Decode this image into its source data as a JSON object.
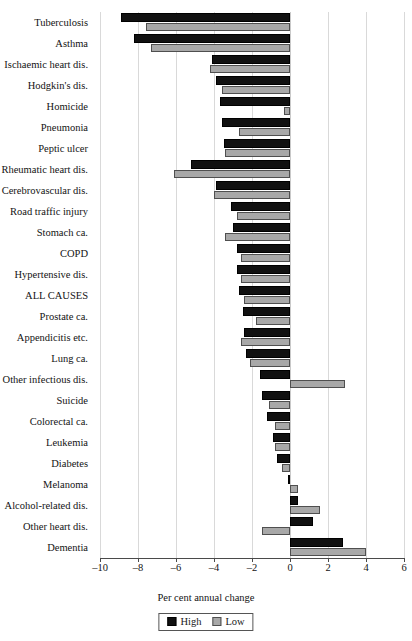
{
  "chart_data": {
    "type": "bar",
    "orientation": "horizontal",
    "title": "",
    "xlabel": "Per cent annual change",
    "ylabel": "",
    "xlim": [
      -10,
      6
    ],
    "xticks": [
      -10,
      -8,
      -6,
      -4,
      -2,
      0,
      2,
      4,
      6
    ],
    "xtick_labels": [
      "–10",
      "–8",
      "–6",
      "–4",
      "–2",
      "0",
      "2",
      "4",
      "6"
    ],
    "grid": true,
    "legend_position": "bottom",
    "categories": [
      "Tuberculosis",
      "Asthma",
      "Ischaemic heart dis.",
      "Hodgkin's dis.",
      "Homicide",
      "Pneumonia",
      "Peptic ulcer",
      "Rheumatic heart dis.",
      "Cerebrovascular dis.",
      "Road traffic injury",
      "Stomach ca.",
      "COPD",
      "Hypertensive dis.",
      "ALL CAUSES",
      "Prostate ca.",
      "Appendicitis etc.",
      "Lung ca.",
      "Other infectious dis.",
      "Suicide",
      "Colorectal ca.",
      "Leukemia",
      "Diabetes",
      "Melanoma",
      "Alcohol-related dis.",
      "Other heart dis.",
      "Dementia"
    ],
    "series": [
      {
        "name": "High",
        "color": "#111111",
        "values": [
          -8.9,
          -8.2,
          -4.1,
          -3.9,
          -3.7,
          -3.6,
          -3.5,
          -5.2,
          -3.9,
          -3.1,
          -3.0,
          -2.8,
          -2.8,
          -2.7,
          -2.5,
          -2.4,
          -2.3,
          -1.6,
          -1.5,
          -1.2,
          -0.9,
          -0.7,
          -0.1,
          0.4,
          1.2,
          2.8
        ]
      },
      {
        "name": "Low",
        "color": "#a8a8a8",
        "values": [
          -7.6,
          -7.3,
          -4.2,
          -3.6,
          -0.3,
          -2.7,
          -3.4,
          -6.1,
          -4.0,
          -2.8,
          -3.4,
          -2.6,
          -2.6,
          -2.4,
          -1.8,
          -2.6,
          -2.1,
          2.9,
          -1.1,
          -0.8,
          -0.8,
          -0.4,
          0.4,
          1.6,
          -1.5,
          4.0
        ]
      }
    ]
  },
  "legend": {
    "items": [
      {
        "label": "High",
        "swatch": "high"
      },
      {
        "label": "Low",
        "swatch": "low"
      }
    ]
  }
}
